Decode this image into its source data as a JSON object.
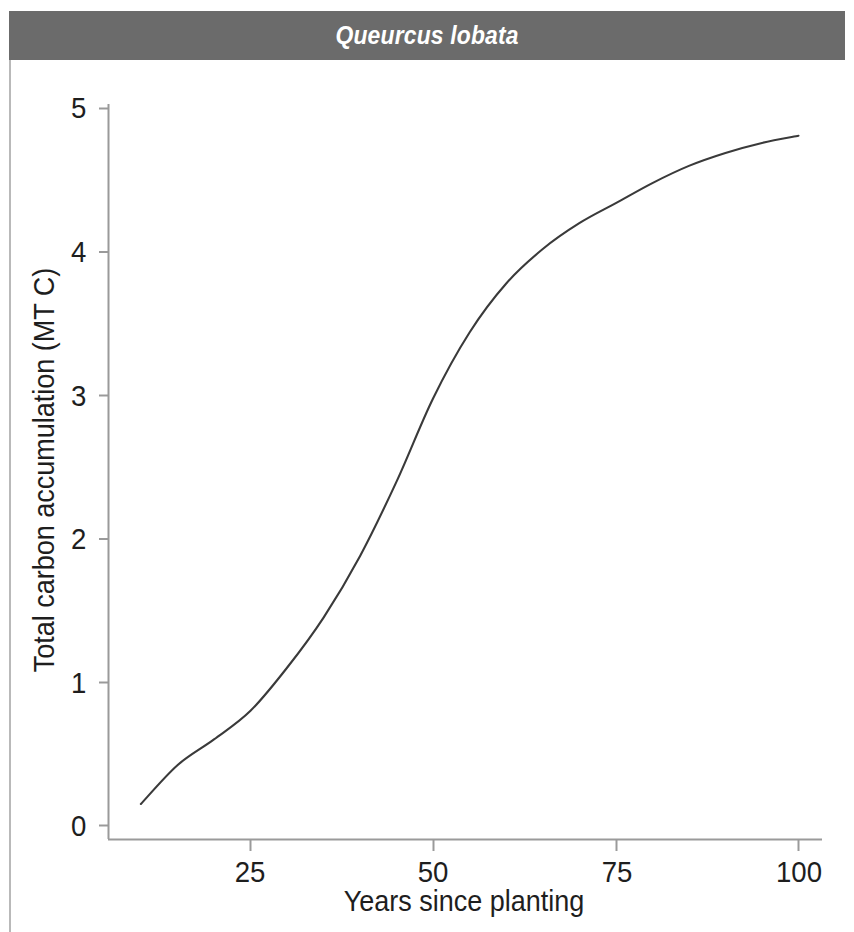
{
  "header": {
    "title": "Queurcus lobata",
    "banner_color": "#6b6b6b",
    "title_color": "#ffffff"
  },
  "chart_data": {
    "type": "line",
    "title": "Queurcus lobata",
    "xlabel": "Years since planting",
    "ylabel": "Total carbon accumulation (MT C)",
    "xlim": [
      5,
      102
    ],
    "ylim": [
      0,
      5
    ],
    "xticks": [
      25,
      50,
      75,
      100
    ],
    "xtick_labels": [
      "25",
      "50",
      "75",
      "100"
    ],
    "yticks": [
      0,
      1,
      2,
      3,
      4,
      5
    ],
    "ytick_labels": [
      "0",
      "1",
      "2",
      "3",
      "4",
      "5"
    ],
    "grid": false,
    "legend": null,
    "line_color": "#3a3a3a",
    "line_width": 2,
    "series": [
      {
        "name": "Total carbon accumulation",
        "x": [
          10,
          15,
          20,
          25,
          30,
          35,
          40,
          45,
          50,
          55,
          60,
          65,
          70,
          75,
          80,
          85,
          90,
          95,
          100
        ],
        "y": [
          0.15,
          0.42,
          0.6,
          0.8,
          1.1,
          1.45,
          1.88,
          2.4,
          2.98,
          3.44,
          3.78,
          4.02,
          4.2,
          4.34,
          4.48,
          4.6,
          4.69,
          4.76,
          4.81
        ]
      }
    ],
    "annotations": [
      {
        "type": "line-break-artifact",
        "x": 78.5,
        "y": 4.33,
        "note": "small white gap in the plotted curve"
      }
    ]
  },
  "axes": {
    "axis_color": "#8a8a8a",
    "tick_label_color": "#1e1e1e"
  }
}
